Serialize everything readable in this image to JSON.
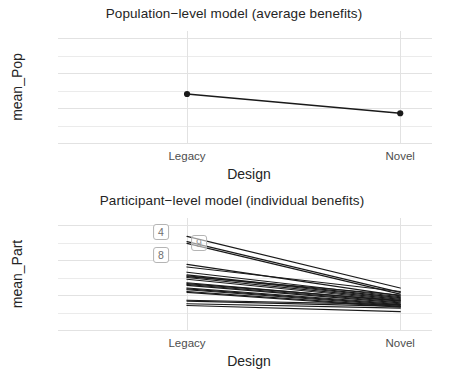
{
  "figure": {
    "axis_label_x": "Design",
    "background": "#ffffff",
    "grid_color": "#e2e2e2",
    "line_color": "#1a1a1a"
  },
  "panels": [
    {
      "id": "pop",
      "title": "Population−level model (average benefits)",
      "ylabel": "mean_Pop",
      "xlabel": "Design",
      "yticks": [
        "0",
        "20",
        "40",
        "60"
      ],
      "xticks": [
        "Legacy",
        "Novel"
      ]
    },
    {
      "id": "part",
      "title": "Participant−level model (individual benefits)",
      "ylabel": "mean_Part",
      "xlabel": "Design",
      "yticks": [
        "0",
        "20",
        "40",
        "60"
      ],
      "xticks": [
        "Legacy",
        "Novel"
      ],
      "point_labels": [
        {
          "text": "4",
          "x": 0,
          "y": 56
        },
        {
          "text": "8",
          "x": 0,
          "y": 43
        },
        {
          "text": "9",
          "x": 0,
          "y": 50
        }
      ]
    }
  ],
  "chart_data": [
    {
      "type": "line",
      "title": "Population−level model (average benefits)",
      "xlabel": "Design",
      "ylabel": "mean_Pop",
      "categories": [
        "Legacy",
        "Novel"
      ],
      "values": [
        28,
        17
      ],
      "ylim": [
        0,
        64
      ],
      "yticks": [
        0,
        20,
        40,
        60
      ],
      "grid": true,
      "legend": "none",
      "markers": "filled-circle"
    },
    {
      "type": "line",
      "title": "Participant−level model (individual benefits)",
      "xlabel": "Design",
      "ylabel": "mean_Part",
      "categories": [
        "Legacy",
        "Novel"
      ],
      "ylim": [
        0,
        64
      ],
      "yticks": [
        0,
        20,
        40,
        60
      ],
      "grid": true,
      "legend": "none",
      "markers": "none",
      "series": [
        {
          "name": "4",
          "values": [
            53.5,
            24.0
          ]
        },
        {
          "name": "9",
          "values": [
            50.5,
            21.5
          ]
        },
        {
          "name": "s3",
          "values": [
            49.5,
            20.5
          ]
        },
        {
          "name": "8",
          "values": [
            37.5,
            19.5
          ]
        },
        {
          "name": "s5",
          "values": [
            33.0,
            19.0
          ]
        },
        {
          "name": "s6",
          "values": [
            31.5,
            18.5
          ]
        },
        {
          "name": "s7",
          "values": [
            31.0,
            18.0
          ]
        },
        {
          "name": "s8",
          "values": [
            30.0,
            17.5
          ]
        },
        {
          "name": "s9",
          "values": [
            29.0,
            17.0
          ]
        },
        {
          "name": "s10",
          "values": [
            27.0,
            16.5
          ]
        },
        {
          "name": "s11",
          "values": [
            26.0,
            16.0
          ]
        },
        {
          "name": "s12",
          "values": [
            25.5,
            15.5
          ]
        },
        {
          "name": "s13",
          "values": [
            24.0,
            15.0
          ]
        },
        {
          "name": "s14",
          "values": [
            23.5,
            14.5
          ]
        },
        {
          "name": "s15",
          "values": [
            23.0,
            14.0
          ]
        },
        {
          "name": "s16",
          "values": [
            22.0,
            13.5
          ]
        },
        {
          "name": "s17",
          "values": [
            21.5,
            13.0
          ]
        },
        {
          "name": "s18",
          "values": [
            17.0,
            14.5
          ]
        },
        {
          "name": "s19",
          "values": [
            16.5,
            13.5
          ]
        },
        {
          "name": "s20",
          "values": [
            15.0,
            12.5
          ]
        },
        {
          "name": "s21",
          "values": [
            14.0,
            10.5
          ]
        },
        {
          "name": "s22",
          "values": [
            36.0,
            22.0
          ]
        },
        {
          "name": "s23",
          "values": [
            30.5,
            20.0
          ]
        },
        {
          "name": "s24",
          "values": [
            26.5,
            16.8
          ]
        }
      ]
    }
  ]
}
